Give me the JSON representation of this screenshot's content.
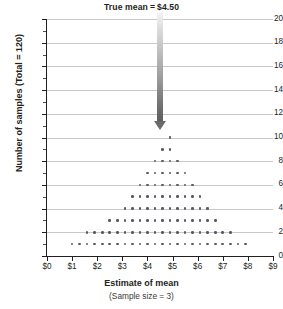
{
  "chart_data": {
    "type": "scatter",
    "plot_style": "dot-plot",
    "title_parts": {
      "label": "True mean",
      "equals": "=",
      "value": "$4.50"
    },
    "xlabel": "Estimate of mean",
    "xsublabel": "(Sample size = 3)",
    "ylabel": "Number of samples (Total = 120)",
    "xlim": [
      0,
      9
    ],
    "ylim": [
      0,
      20
    ],
    "xticks": [
      0,
      1,
      2,
      3,
      4,
      5,
      6,
      7,
      8,
      9
    ],
    "xtick_labels": [
      "$0",
      "$1",
      "$2",
      "$3",
      "$4",
      "$5",
      "$6",
      "$7",
      "$8",
      "$9"
    ],
    "yticks": [
      0,
      2,
      4,
      6,
      8,
      10,
      12,
      14,
      16,
      18,
      20
    ],
    "ytick_labels": [
      "0",
      "2",
      "4",
      "6",
      "8",
      "10",
      "12",
      "14",
      "16",
      "18",
      "20"
    ],
    "yticks_minor": [
      1,
      3,
      5,
      7,
      9,
      11,
      13,
      15,
      17,
      19
    ],
    "grid": "horizontal-major",
    "legend": "none",
    "total_samples": 120,
    "true_mean": 4.5,
    "sample_size": 3,
    "bin_width": 0.3,
    "annotations": [
      {
        "name": "true-mean-arrow",
        "x": 4.5,
        "from_y": 20,
        "to_y": 10.6,
        "color": "#6e6e6e"
      }
    ],
    "dot_counts_by_bin": [
      {
        "x": 1.0,
        "count": 1
      },
      {
        "x": 1.3,
        "count": 1
      },
      {
        "x": 1.6,
        "count": 2
      },
      {
        "x": 1.9,
        "count": 2
      },
      {
        "x": 2.2,
        "count": 2
      },
      {
        "x": 2.5,
        "count": 3
      },
      {
        "x": 2.8,
        "count": 3
      },
      {
        "x": 3.1,
        "count": 4
      },
      {
        "x": 3.4,
        "count": 5
      },
      {
        "x": 3.7,
        "count": 6
      },
      {
        "x": 4.0,
        "count": 7
      },
      {
        "x": 4.3,
        "count": 8
      },
      {
        "x": 4.6,
        "count": 9
      },
      {
        "x": 4.9,
        "count": 10
      },
      {
        "x": 5.2,
        "count": 8
      },
      {
        "x": 5.5,
        "count": 7
      },
      {
        "x": 5.8,
        "count": 6
      },
      {
        "x": 6.1,
        "count": 5
      },
      {
        "x": 6.4,
        "count": 4
      },
      {
        "x": 6.7,
        "count": 3
      },
      {
        "x": 7.0,
        "count": 2
      },
      {
        "x": 7.3,
        "count": 2
      },
      {
        "x": 7.6,
        "count": 1
      },
      {
        "x": 7.9,
        "count": 1
      }
    ],
    "rows": [
      {
        "y": 10,
        "x_start": 4.0,
        "x_end": 4.9,
        "n": 4
      },
      {
        "y": 9,
        "x_start": 3.7,
        "x_end": 5.2,
        "n": 6
      },
      {
        "y": 8,
        "x_start": 3.4,
        "x_end": 5.5,
        "n": 8
      },
      {
        "y": 7,
        "x_start": 3.1,
        "x_end": 5.8,
        "n": 10
      },
      {
        "y": 6,
        "x_start": 2.8,
        "x_end": 6.1,
        "n": 12
      },
      {
        "y": 5,
        "x_start": 2.5,
        "x_end": 6.4,
        "n": 14
      },
      {
        "y": 4,
        "x_start": 2.2,
        "x_end": 6.7,
        "n": 16
      },
      {
        "y": 3,
        "x_start": 1.9,
        "x_end": 7.0,
        "n": 18
      },
      {
        "y": 2,
        "x_start": 1.6,
        "x_end": 7.3,
        "n": 20
      },
      {
        "y": 1,
        "x_start": 1.0,
        "x_end": 7.9,
        "n": 24
      }
    ]
  }
}
